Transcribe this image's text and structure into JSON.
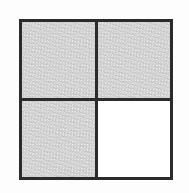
{
  "figure": {
    "type": "grid-diagram",
    "rows": 2,
    "columns": 2,
    "total_cells": 4,
    "shaded_cells": 3,
    "unshaded_cells": 1,
    "fraction_shaded": "3/4",
    "colors": {
      "shaded_fill": "#cacaca",
      "unshaded_fill": "#ffffff",
      "line": "#2b2b2b",
      "background": "#fdfdfd"
    },
    "cells": [
      {
        "id": "cell-r1c1",
        "row": 1,
        "column": 1,
        "position": "top-left",
        "state": "shaded",
        "fill": "#cacaca"
      },
      {
        "id": "cell-r1c2",
        "row": 1,
        "column": 2,
        "position": "top-right",
        "state": "shaded",
        "fill": "#cacaca"
      },
      {
        "id": "cell-r2c1",
        "row": 2,
        "column": 1,
        "position": "bottom-left",
        "state": "shaded",
        "fill": "#cacaca"
      },
      {
        "id": "cell-r2c2",
        "row": 2,
        "column": 2,
        "position": "bottom-right",
        "state": "unshaded",
        "fill": "#ffffff"
      }
    ]
  }
}
